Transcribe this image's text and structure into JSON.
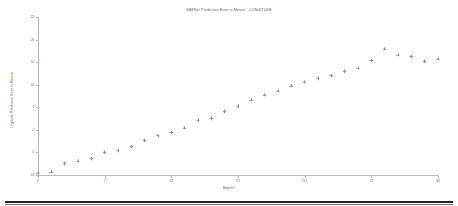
{
  "chart_data": {
    "type": "scatter",
    "title": "NBFNet Prediction Error in Meters - LONGITUDE",
    "xlabel": "Epoch#",
    "ylabel": "Logitude Prediction Error in Meters",
    "xlim": [
      0,
      30
    ],
    "ylim": [
      -10,
      25
    ],
    "xticks": [
      0,
      5,
      10,
      15,
      20,
      25,
      30
    ],
    "xtick_labels": [
      "0",
      "5",
      "10",
      "15",
      "20",
      "25",
      "30"
    ],
    "yticks": [
      -10,
      -5,
      0,
      5,
      10,
      15,
      20,
      25
    ],
    "ytick_labels": [
      "-10",
      "-5",
      "0",
      "5",
      "10",
      "15",
      "20",
      "25"
    ],
    "grid": false,
    "legend": false,
    "marker": "plus",
    "marker_color": "#9a9ca0",
    "x": [
      0,
      1,
      2,
      3,
      4,
      5,
      6,
      7,
      8,
      9,
      10,
      11,
      12,
      13,
      14,
      15,
      16,
      17,
      18,
      19,
      20,
      21,
      22,
      23,
      24,
      25,
      26,
      27,
      28,
      29,
      30
    ],
    "values": [
      -9.6,
      -9.3,
      -7.4,
      -6.9,
      -6.4,
      -5.0,
      -4.6,
      -3.7,
      -2.3,
      -1.3,
      -0.6,
      0.4,
      2.1,
      2.6,
      4.1,
      5.2,
      6.6,
      7.7,
      8.6,
      9.7,
      10.6,
      11.4,
      12.0,
      13.0,
      13.7,
      15.3,
      17.9,
      16.6,
      16.2,
      15.2,
      15.7
    ],
    "series_note": "single series"
  },
  "axes": {
    "title": "NBFNet Prediction Error in Meters - LONGITUDE",
    "xlabel": "Epoch#",
    "ylabel": "Logitude Prediction Error in Meters"
  },
  "colors": {
    "marker": "#9a9ca0",
    "axis": "#b9bbbd",
    "text": "#58595b",
    "tick_text": "#6a6c6e",
    "bottom_bar": "#231f20",
    "background": "#ffffff"
  }
}
